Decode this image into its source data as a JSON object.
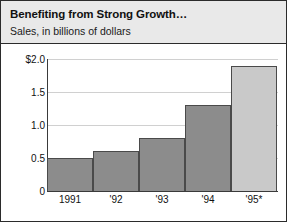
{
  "chart_data": {
    "type": "bar",
    "title": "Benefiting from Strong Growth…",
    "subtitle": "Sales, in billions of dollars",
    "xlabel": "",
    "ylabel": "",
    "categories": [
      "1991",
      "'92",
      "'93",
      "'94",
      "'95*"
    ],
    "values": [
      0.5,
      0.6,
      0.8,
      1.3,
      1.9
    ],
    "ylim": [
      0,
      2.0
    ],
    "yticks": [
      0,
      0.5,
      1.0,
      1.5,
      2.0
    ],
    "ytick_labels": [
      "0",
      "0.5",
      "1.0",
      "1.5",
      "$2.0"
    ],
    "grid": true,
    "legend": "none",
    "bar_colors": [
      "#8c8c8c",
      "#8c8c8c",
      "#8c8c8c",
      "#8c8c8c",
      "#c9c9c9"
    ],
    "note": "'95* is an estimate, indicated by the asterisk and lighter bar"
  },
  "colors": {
    "header_background": "#e9e9e9",
    "frame_border": "#2b2b2b",
    "bar_actual": "#8c8c8c",
    "bar_estimate": "#c9c9c9",
    "bar_outline": "#4a4a4a",
    "gridline": "#d0d0d0",
    "text": "#111111"
  }
}
